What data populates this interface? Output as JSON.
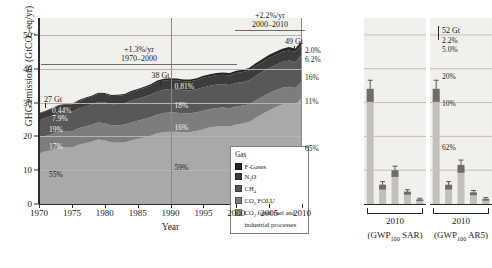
{
  "chart_data": {
    "type": "area",
    "title": "",
    "xlabel": "Year",
    "ylabel": "GHG emissions (GtCO2-eq/yr)",
    "ylabel_parts": {
      "pre": "GHG emissions (GtCO",
      "sub": "2",
      "post": "-eq/yr)"
    },
    "xlim": [
      1970,
      2010
    ],
    "ylim": [
      0,
      55
    ],
    "yticks": [
      0,
      10,
      20,
      30,
      40,
      50
    ],
    "xticks": [
      1970,
      1975,
      1980,
      1985,
      1990,
      1995,
      2000,
      2005,
      2010
    ],
    "grid": true,
    "legend_position": "inside-bottom-right",
    "legend_title": "Gas",
    "series": [
      {
        "name": "CO2 fossil fuel and industrial processes",
        "color": "#a9a9a9",
        "values": [
          14.9,
          15.5,
          16.0,
          16.8,
          16.8,
          16.7,
          17.5,
          18.0,
          18.4,
          19.1,
          18.8,
          18.2,
          18.1,
          18.2,
          18.8,
          19.2,
          19.7,
          20.2,
          20.9,
          21.2,
          21.4,
          21.4,
          21.2,
          21.3,
          21.6,
          22.1,
          22.7,
          22.9,
          22.9,
          22.9,
          23.5,
          23.8,
          24.3,
          25.5,
          26.7,
          27.7,
          28.6,
          29.4,
          29.8,
          29.4,
          31.5
        ]
      },
      {
        "name": "CO2 FOLU",
        "color": "#7d7d7d",
        "values": [
          4.6,
          4.6,
          4.7,
          4.7,
          4.8,
          4.8,
          4.9,
          4.9,
          5.0,
          5.0,
          5.1,
          5.1,
          5.2,
          5.3,
          5.3,
          5.4,
          5.4,
          5.5,
          5.6,
          5.7,
          5.7,
          5.6,
          5.6,
          5.5,
          5.5,
          5.5,
          5.4,
          5.5,
          5.6,
          5.4,
          5.3,
          5.3,
          5.2,
          5.2,
          5.1,
          5.1,
          5.0,
          5.0,
          4.9,
          4.9,
          4.9
        ]
      },
      {
        "name": "CH4",
        "color": "#585858",
        "values": [
          5.2,
          5.3,
          5.4,
          5.5,
          5.6,
          5.7,
          5.8,
          5.9,
          6.0,
          6.1,
          6.2,
          6.2,
          6.3,
          6.3,
          6.4,
          6.5,
          6.6,
          6.7,
          6.8,
          6.9,
          6.9,
          6.9,
          6.8,
          6.8,
          6.8,
          6.9,
          6.9,
          6.9,
          6.9,
          6.9,
          7.0,
          7.0,
          7.1,
          7.2,
          7.3,
          7.4,
          7.5,
          7.6,
          7.7,
          7.7,
          7.8
        ]
      },
      {
        "name": "N2O",
        "color": "#3c3c3c",
        "values": [
          2.0,
          2.0,
          2.1,
          2.1,
          2.2,
          2.2,
          2.2,
          2.3,
          2.3,
          2.4,
          2.4,
          2.4,
          2.4,
          2.4,
          2.5,
          2.5,
          2.6,
          2.6,
          2.7,
          2.7,
          2.7,
          2.7,
          2.7,
          2.7,
          2.8,
          2.8,
          2.8,
          2.8,
          2.8,
          2.8,
          2.9,
          2.9,
          2.9,
          3.0,
          3.0,
          3.0,
          3.0,
          3.0,
          3.0,
          3.0,
          3.0
        ]
      },
      {
        "name": "F-Gases",
        "color": "#262626",
        "values": [
          0.2,
          0.2,
          0.2,
          0.2,
          0.2,
          0.2,
          0.3,
          0.3,
          0.3,
          0.3,
          0.3,
          0.3,
          0.3,
          0.3,
          0.4,
          0.4,
          0.4,
          0.4,
          0.5,
          0.5,
          0.5,
          0.5,
          0.5,
          0.5,
          0.5,
          0.6,
          0.6,
          0.6,
          0.7,
          0.7,
          0.7,
          0.7,
          0.8,
          0.8,
          0.8,
          0.9,
          0.9,
          0.9,
          1.0,
          1.0,
          1.0
        ]
      }
    ],
    "annotations": [
      {
        "id": "rate-1970-2000",
        "rate": "+1.3%/yr",
        "period": "1970–2000"
      },
      {
        "id": "rate-2000-2010",
        "rate": "+2.2%/yr",
        "period": "2000–2010"
      }
    ],
    "column_callouts": [
      {
        "year": 1970,
        "total": "27 Gt",
        "shares": [
          "0.44%",
          "7.9%",
          "19%",
          "17%",
          "55%"
        ]
      },
      {
        "year": 1990,
        "total": "38 Gt",
        "shares": [
          "0.81%",
          "7.4%",
          "18%",
          "16%",
          "59%"
        ]
      },
      {
        "year": 2010,
        "total": "49 Gt",
        "shares": [
          "2.0%",
          "6.2%",
          "16%",
          "11%",
          "65%"
        ]
      }
    ],
    "right_panels": [
      {
        "id": "gwp100-sar",
        "year_label": "2010",
        "metric_label_parts": {
          "pre": "(GWP",
          "sub": "100",
          "post": " SAR)"
        },
        "total": "",
        "bars": [
          {
            "name": "CO2 fossil fuel and industrial processes",
            "value": 32.0,
            "low": 28.0,
            "high": 36.6
          },
          {
            "name": "CO2 FOLU",
            "value": 5.0,
            "low": 3.4,
            "high": 6.6
          },
          {
            "name": "CH4",
            "value": 9.0,
            "low": 6.8,
            "high": 11.2
          },
          {
            "name": "N2O",
            "value": 3.2,
            "low": 2.2,
            "high": 4.2
          },
          {
            "name": "F-Gases",
            "value": 1.1,
            "low": 0.6,
            "high": 1.7
          }
        ]
      },
      {
        "id": "gwp100-ar5",
        "year_label": "2010",
        "metric_label_parts": {
          "pre": "(GWP",
          "sub": "100",
          "post": " AR5)"
        },
        "total": "52 Gt",
        "shares": [
          "2.2%",
          "5.0%",
          "20%",
          "10%",
          "62%"
        ],
        "bars": [
          {
            "name": "CO2 fossil fuel and industrial processes",
            "value": 32.0,
            "low": 28.0,
            "high": 36.6
          },
          {
            "name": "CO2 FOLU",
            "value": 5.0,
            "low": 3.4,
            "high": 6.6
          },
          {
            "name": "CH4",
            "value": 10.4,
            "low": 7.8,
            "high": 13.0
          },
          {
            "name": "N2O",
            "value": 3.0,
            "low": 2.1,
            "high": 4.0
          },
          {
            "name": "F-Gases",
            "value": 1.2,
            "low": 0.7,
            "high": 1.9
          }
        ]
      }
    ]
  },
  "axis": {
    "y_title_pre": "GHG emissions (GtCO",
    "y_title_sub": "2",
    "y_title_post": "-eq/yr)",
    "x_title": "Year",
    "yticks": [
      "50",
      "40",
      "30",
      "20",
      "10",
      "0"
    ],
    "xticks": [
      "1970",
      "1975",
      "1980",
      "1985",
      "1990",
      "1995",
      "2000",
      "2005",
      "2010"
    ]
  },
  "annotations": {
    "rate1_value": "+1.3%/yr",
    "rate1_period": "1970–2000",
    "rate2_value": "+2.2%/yr",
    "rate2_period": "2000–2010",
    "gt1970": "27 Gt",
    "gt1990": "38 Gt",
    "gt2010": "49 Gt",
    "gt_panel": "52 Gt",
    "p1970_fgas": "0.44%",
    "p1970_n2o": "7.9%",
    "p1970_ch4": "19%",
    "p1970_folu": "17%",
    "p1970_co2": "55%",
    "p1990_fgas": "0.81%",
    "p1990_ch4": "18%",
    "p1990_folu": "16%",
    "p1990_co2": "59%",
    "p2010_fgas": "2.0%",
    "p2010_n2o": "6.2%",
    "p2010_ch4": "16%",
    "p2010_folu": "11%",
    "p2010_co2": "65%",
    "ppanel_fgas": "2.2%",
    "ppanel_n2o": "5.0%",
    "ppanel_ch4": "20%",
    "ppanel_folu": "10%",
    "ppanel_co2": "62%"
  },
  "legend": {
    "title": "Gas",
    "items": [
      {
        "label": "F-Gases",
        "color": "#262626",
        "sub": ""
      },
      {
        "label_pre": "N",
        "label_sub": "2",
        "label_post": "O",
        "color": "#3c3c3c"
      },
      {
        "label_pre": "CH",
        "label_sub": "4",
        "label_post": "",
        "color": "#585858"
      },
      {
        "label_pre": "CO",
        "label_sub": "2",
        "label_post": " FOLU",
        "color": "#7d7d7d"
      },
      {
        "label_pre": "CO",
        "label_sub": "2",
        "label_post": " fossil fuel and industrial processes",
        "color": "#a9a9a9"
      }
    ]
  },
  "panels": {
    "left_year": "2010",
    "left_metric_pre": "(GWP",
    "left_metric_sub": "100",
    "left_metric_post": " SAR)",
    "right_year": "2010",
    "right_metric_pre": "(GWP",
    "right_metric_sub": "100",
    "right_metric_post": " AR5)"
  },
  "colors": {
    "fgases": "#262626",
    "n2o": "#3c3c3c",
    "ch4": "#585858",
    "co2_folu": "#7d7d7d",
    "co2_ffi": "#a9a9a9",
    "plot_bg": "#f2f0ec",
    "grid": "#b9b3ab",
    "axis": "#2b2b2b"
  }
}
